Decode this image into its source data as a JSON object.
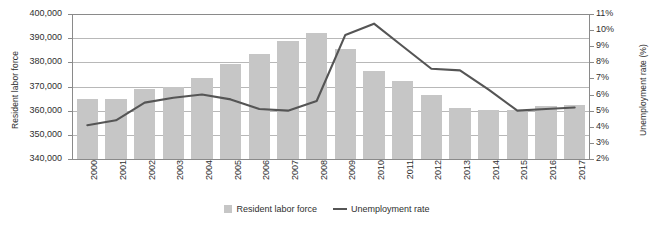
{
  "chart_data": {
    "type": "bar",
    "title": "",
    "xlabel": "",
    "ylabel": "Resident labor force",
    "y2label": "Unemployment rate (%)",
    "categories": [
      "2000",
      "2001",
      "2002",
      "2003",
      "2004",
      "2005",
      "2006",
      "2007",
      "2008",
      "2009",
      "2010",
      "2011",
      "2012",
      "2013",
      "2014",
      "2015",
      "2016",
      "2017"
    ],
    "ylim": [
      340000,
      400000
    ],
    "y2lim": [
      2,
      11
    ],
    "yticks": [
      340000,
      350000,
      360000,
      370000,
      380000,
      390000,
      400000
    ],
    "ytick_labels": [
      "340,000",
      "350,000",
      "360,000",
      "370,000",
      "380,000",
      "390,000",
      "400,000"
    ],
    "y2ticks": [
      2,
      3,
      4,
      5,
      6,
      7,
      8,
      9,
      10,
      11
    ],
    "y2tick_labels": [
      "2%",
      "3%",
      "4%",
      "5%",
      "6%",
      "7%",
      "8%",
      "9%",
      "10%",
      "11%"
    ],
    "grid": true,
    "legend_position": "bottom",
    "series": [
      {
        "name": "Resident labor force",
        "type": "bar",
        "axis": "left",
        "color": "#c6c6c6",
        "values": [
          364700,
          365000,
          368800,
          369800,
          373600,
          379500,
          383400,
          389000,
          392000,
          385500,
          376600,
          372400,
          366300,
          361200,
          360300,
          360200,
          361800,
          362500
        ]
      },
      {
        "name": "Unemployment rate",
        "type": "line",
        "axis": "right",
        "color": "#555555",
        "values": [
          4.1,
          4.4,
          5.5,
          5.8,
          6.0,
          5.7,
          5.1,
          5.0,
          5.6,
          9.7,
          10.4,
          9.0,
          7.6,
          7.5,
          6.3,
          5.0,
          5.1,
          5.2
        ]
      }
    ]
  },
  "legend": {
    "items": [
      {
        "label": "Resident labor force",
        "marker": "bar-swatch"
      },
      {
        "label": "Unemployment rate",
        "marker": "line-swatch"
      }
    ]
  }
}
